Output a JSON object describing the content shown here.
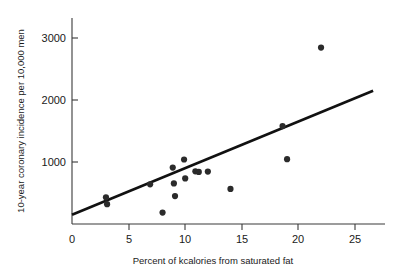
{
  "chart_data": {
    "type": "scatter",
    "title": "",
    "subtitle": "",
    "xlabel": "Percent of kcalories from saturated fat",
    "ylabel": "10-year coronary incidence per 10,000 men",
    "xlim": [
      0,
      27.5
    ],
    "ylim": [
      0,
      3300
    ],
    "xticks": [
      0,
      5,
      10,
      15,
      20,
      25
    ],
    "xtick_labels": [
      "0",
      "5",
      "10",
      "15",
      "20",
      "25"
    ],
    "yticks": [
      0,
      1000,
      2000,
      3000
    ],
    "ytick_labels": [
      "0",
      "1000",
      "2000",
      "3000"
    ],
    "grid": false,
    "legend": "none",
    "marker_color": "#2b2b2b",
    "line_color": "#111111",
    "axis_color": "#3a3a3a",
    "points": [
      {
        "x": 3.0,
        "y": 430
      },
      {
        "x": 3.1,
        "y": 320
      },
      {
        "x": 6.9,
        "y": 640
      },
      {
        "x": 8.0,
        "y": 185
      },
      {
        "x": 8.9,
        "y": 910
      },
      {
        "x": 9.0,
        "y": 655
      },
      {
        "x": 9.1,
        "y": 450
      },
      {
        "x": 9.9,
        "y": 1040
      },
      {
        "x": 10.0,
        "y": 735
      },
      {
        "x": 10.9,
        "y": 850
      },
      {
        "x": 11.2,
        "y": 840
      },
      {
        "x": 12.0,
        "y": 845
      },
      {
        "x": 14.0,
        "y": 565
      },
      {
        "x": 18.6,
        "y": 1580
      },
      {
        "x": 19.0,
        "y": 1045
      },
      {
        "x": 22.0,
        "y": 2845
      }
    ],
    "fit_line": {
      "name": "least-squares regression line",
      "x_start": 0.0,
      "y_start": 150,
      "x_end": 26.6,
      "y_end": 2150
    }
  }
}
